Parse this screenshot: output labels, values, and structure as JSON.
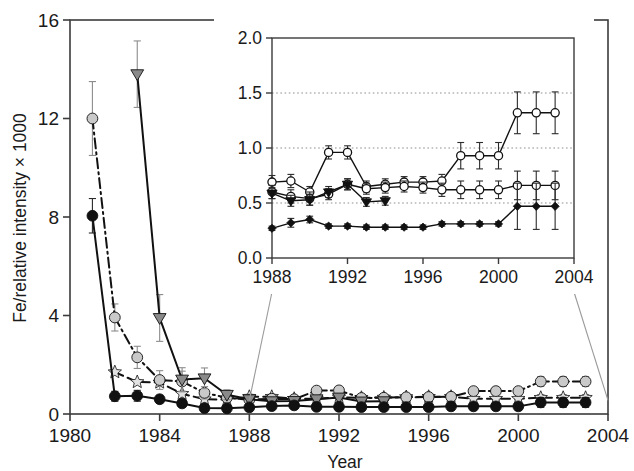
{
  "figure": {
    "background": "#ffffff",
    "axis_color": "#3b3b3b",
    "text_color": "#1a1a1a"
  },
  "chart_data": {
    "type": "line",
    "title": "",
    "xlabel": "Year",
    "ylabel": "Fe/relative intensity × 1000",
    "xlim": [
      1980,
      2004
    ],
    "ylim": [
      0,
      16
    ],
    "xticks": [
      1980,
      1984,
      1988,
      1992,
      1996,
      2000,
      2004
    ],
    "xtick_labels": [
      "1980",
      "1984",
      "1988",
      "1992",
      "1996",
      "2000",
      "2004"
    ],
    "yticks": [
      0,
      4,
      8,
      12,
      16
    ],
    "ytick_labels": [
      "0",
      "4",
      "8",
      "12",
      "16"
    ],
    "grid": false,
    "legend": "none",
    "series": [
      {
        "name": "series-dark-circle",
        "marker": "circle",
        "marker_fill": "#111111",
        "line_color": "#111111",
        "line_style": "solid",
        "x": [
          1981,
          1982,
          1983,
          1984,
          1985,
          1986,
          1987,
          1988,
          1989,
          1990,
          1991,
          1992,
          1993,
          1994,
          1995,
          1996,
          1997,
          1998,
          1999,
          2000,
          2001,
          2002,
          2003
        ],
        "y": [
          8.05,
          0.72,
          0.74,
          0.6,
          0.43,
          0.24,
          0.23,
          0.27,
          0.32,
          0.35,
          0.29,
          0.29,
          0.28,
          0.28,
          0.28,
          0.28,
          0.31,
          0.31,
          0.31,
          0.31,
          0.47,
          0.47,
          0.47
        ],
        "yerr_up": [
          0.7,
          0.2,
          0.22,
          0.16,
          0.1,
          0.05,
          0.05,
          0.04,
          0.05,
          0.05,
          0.04,
          0.04,
          0.04,
          0.04,
          0.04,
          0.04,
          0.04,
          0.04,
          0.04,
          0.04,
          0.2,
          0.2,
          0.2
        ],
        "yerr_dn": [
          0.7,
          0.2,
          0.22,
          0.16,
          0.1,
          0.05,
          0.05,
          0.04,
          0.05,
          0.05,
          0.04,
          0.04,
          0.04,
          0.04,
          0.04,
          0.04,
          0.04,
          0.04,
          0.04,
          0.04,
          0.2,
          0.2,
          0.2
        ]
      },
      {
        "name": "series-light-circle",
        "marker": "circle",
        "marker_fill": "#c9c9c9",
        "line_color": "#111111",
        "line_style": "dashdot",
        "x": [
          1981,
          1982,
          1983,
          1984,
          1985,
          1986,
          1987,
          1988,
          1989,
          1990,
          1991,
          1992,
          1993,
          1994,
          1995,
          1996,
          1997,
          1998,
          1999,
          2000,
          2001,
          2002,
          2003
        ],
        "y": [
          12.0,
          3.92,
          2.3,
          1.38,
          1.32,
          0.86,
          0.66,
          0.58,
          0.62,
          0.6,
          0.95,
          0.96,
          0.65,
          0.66,
          0.68,
          0.69,
          0.7,
          0.93,
          0.93,
          0.93,
          1.32,
          1.32,
          1.32
        ],
        "yerr_up": [
          1.5,
          0.55,
          0.45,
          0.38,
          0.42,
          0.25,
          0.16,
          0.08,
          0.07,
          0.07,
          0.06,
          0.06,
          0.06,
          0.06,
          0.06,
          0.06,
          0.06,
          0.13,
          0.13,
          0.13,
          0.2,
          0.2,
          0.2
        ],
        "yerr_dn": [
          1.5,
          0.55,
          0.45,
          0.38,
          0.42,
          0.25,
          0.16,
          0.08,
          0.07,
          0.07,
          0.06,
          0.06,
          0.06,
          0.06,
          0.06,
          0.06,
          0.06,
          0.13,
          0.13,
          0.13,
          0.2,
          0.2,
          0.2
        ]
      },
      {
        "name": "series-gray-triangle",
        "marker": "triangle-down",
        "marker_fill": "#8a8a8a",
        "line_color": "#111111",
        "line_style": "solid",
        "x": [
          1983,
          1984,
          1985,
          1986,
          1987,
          1988,
          1989,
          1990,
          1991,
          1992,
          1993,
          1994
        ],
        "y": [
          13.8,
          3.9,
          1.4,
          1.45,
          0.78,
          0.6,
          0.52,
          0.53,
          0.6,
          0.67,
          0.51,
          0.52
        ],
        "yerr_up": [
          1.35,
          0.95,
          0.48,
          0.42,
          0.2,
          0.08,
          0.05,
          0.05,
          0.05,
          0.05,
          0.04,
          0.04
        ],
        "yerr_dn": [
          1.35,
          0.95,
          0.48,
          0.42,
          0.2,
          0.08,
          0.05,
          0.05,
          0.05,
          0.05,
          0.04,
          0.04
        ]
      },
      {
        "name": "series-pale-star",
        "marker": "star",
        "marker_fill": "#e2e2e2",
        "line_color": "#111111",
        "line_style": "dashed",
        "x": [
          1982,
          1983,
          1984,
          1985,
          1986,
          1987,
          1988,
          1989,
          1990,
          1991,
          1992,
          1993,
          1994,
          1995,
          1996,
          1997,
          1998,
          1999,
          2000,
          2001,
          2002,
          2003
        ],
        "y": [
          1.7,
          1.3,
          1.28,
          0.82,
          0.6,
          0.58,
          0.7,
          0.7,
          0.62,
          0.62,
          0.68,
          0.66,
          0.67,
          0.69,
          0.7,
          0.7,
          0.62,
          0.62,
          0.62,
          0.66,
          0.66,
          0.66
        ],
        "yerr_up": [
          0.0,
          0.0,
          0.0,
          0.0,
          0.0,
          0.0,
          0.06,
          0.06,
          0.06,
          0.06,
          0.06,
          0.06,
          0.06,
          0.06,
          0.06,
          0.06,
          0.08,
          0.08,
          0.08,
          0.13,
          0.13,
          0.13
        ],
        "yerr_dn": [
          0.0,
          0.0,
          0.0,
          0.0,
          0.0,
          0.0,
          0.06,
          0.06,
          0.06,
          0.06,
          0.06,
          0.06,
          0.06,
          0.06,
          0.06,
          0.06,
          0.08,
          0.08,
          0.08,
          0.13,
          0.13,
          0.13
        ]
      }
    ]
  },
  "inset": {
    "xlabel": "",
    "ylabel": "",
    "xlim": [
      1988,
      2004
    ],
    "ylim": [
      0.0,
      2.0
    ],
    "xticks": [
      1988,
      1992,
      1996,
      2000,
      2004
    ],
    "xtick_labels": [
      "1988",
      "1992",
      "1996",
      "2000",
      "2004"
    ],
    "yticks": [
      0.0,
      0.5,
      1.0,
      1.5,
      2.0
    ],
    "ytick_labels": [
      "0.0",
      "0.5",
      "1.0",
      "1.5",
      "2.0"
    ],
    "gridlines_y": [
      0.5,
      1.0,
      1.5
    ],
    "grid_style": "dotted",
    "series": [
      {
        "name": "inset-open-circle-upper",
        "marker": "open-circle",
        "x": [
          1988,
          1989,
          1990,
          1991,
          1992,
          1993,
          1994,
          1995,
          1996,
          1997,
          1998,
          1999,
          2000,
          2001,
          2002,
          2003
        ],
        "y": [
          0.69,
          0.7,
          0.6,
          0.96,
          0.96,
          0.65,
          0.67,
          0.69,
          0.69,
          0.7,
          0.93,
          0.93,
          0.93,
          1.32,
          1.32,
          1.32
        ],
        "yerr_up": [
          0.06,
          0.06,
          0.05,
          0.06,
          0.06,
          0.05,
          0.05,
          0.05,
          0.05,
          0.06,
          0.12,
          0.12,
          0.12,
          0.19,
          0.19,
          0.19
        ],
        "yerr_dn": [
          0.06,
          0.06,
          0.05,
          0.06,
          0.06,
          0.05,
          0.05,
          0.05,
          0.05,
          0.06,
          0.12,
          0.12,
          0.12,
          0.19,
          0.19,
          0.19
        ]
      },
      {
        "name": "inset-open-circle-lower",
        "marker": "open-circle",
        "x": [
          1988,
          1989,
          1990,
          1991,
          1992,
          1993,
          1994,
          1995,
          1996,
          1997,
          1998,
          1999,
          2000,
          2001,
          2002,
          2003
        ],
        "y": [
          0.6,
          0.56,
          0.54,
          0.58,
          0.67,
          0.63,
          0.64,
          0.65,
          0.64,
          0.62,
          0.62,
          0.62,
          0.62,
          0.66,
          0.66,
          0.66
        ],
        "yerr_up": [
          0.06,
          0.06,
          0.06,
          0.05,
          0.05,
          0.05,
          0.05,
          0.05,
          0.05,
          0.06,
          0.08,
          0.08,
          0.08,
          0.13,
          0.13,
          0.13
        ],
        "yerr_dn": [
          0.06,
          0.06,
          0.06,
          0.05,
          0.05,
          0.05,
          0.05,
          0.05,
          0.05,
          0.06,
          0.08,
          0.08,
          0.08,
          0.13,
          0.13,
          0.13
        ]
      },
      {
        "name": "inset-filled-triangle",
        "marker": "triangle-down-filled",
        "x": [
          1988,
          1989,
          1990,
          1991,
          1992,
          1993,
          1994
        ],
        "y": [
          0.59,
          0.52,
          0.53,
          0.6,
          0.67,
          0.51,
          0.52
        ],
        "yerr_up": [
          0.05,
          0.05,
          0.05,
          0.05,
          0.05,
          0.04,
          0.04
        ],
        "yerr_dn": [
          0.05,
          0.05,
          0.05,
          0.05,
          0.05,
          0.04,
          0.04
        ]
      },
      {
        "name": "inset-filled-diamond-square",
        "marker": "filled-diamond",
        "x": [
          1988,
          1989,
          1990,
          1991,
          1992,
          1993,
          1994,
          1995,
          1996,
          1997,
          1998,
          1999,
          2000,
          2001,
          2002,
          2003
        ],
        "y": [
          0.27,
          0.32,
          0.35,
          0.29,
          0.29,
          0.28,
          0.28,
          0.28,
          0.28,
          0.31,
          0.31,
          0.31,
          0.31,
          0.47,
          0.47,
          0.47
        ],
        "yerr_up": [
          0.02,
          0.04,
          0.03,
          0.02,
          0.02,
          0.02,
          0.02,
          0.02,
          0.02,
          0.02,
          0.02,
          0.02,
          0.02,
          0.21,
          0.21,
          0.21
        ],
        "yerr_dn": [
          0.02,
          0.04,
          0.03,
          0.02,
          0.02,
          0.02,
          0.02,
          0.02,
          0.02,
          0.02,
          0.02,
          0.02,
          0.02,
          0.21,
          0.21,
          0.21
        ]
      }
    ]
  }
}
